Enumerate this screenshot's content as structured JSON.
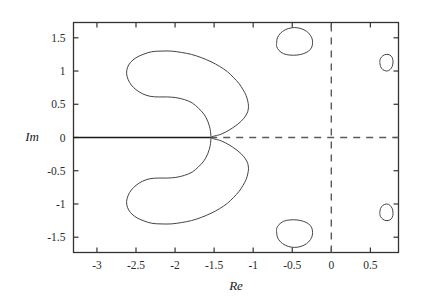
{
  "chart_data": {
    "type": "line",
    "title": "",
    "xlabel": "Re",
    "ylabel": "Im",
    "xlim": [
      -3.3,
      0.86
    ],
    "ylim": [
      -1.73,
      1.73
    ],
    "grid": false,
    "legend": null,
    "x_ticks": [
      -3,
      -2.5,
      -2,
      -1.5,
      -1,
      -0.5,
      0,
      0.5
    ],
    "x_tick_labels": [
      "-3",
      "-2.5",
      "-2",
      "-1.5",
      "-1",
      "-0.5",
      "0",
      "0.5"
    ],
    "y_ticks": [
      1.5,
      1,
      0.5,
      0,
      -0.5,
      -1,
      -1.5
    ],
    "y_tick_labels": [
      "1.5",
      "1",
      "0.5",
      "0",
      "-0.5",
      "-1",
      "-1.5"
    ],
    "reference_lines": [
      {
        "name": "real-axis-solid",
        "orientation": "horizontal",
        "value": 0,
        "style": "solid",
        "x_from": -3.3,
        "x_to": -1.55
      },
      {
        "name": "real-axis-dashed",
        "orientation": "horizontal",
        "value": 0,
        "style": "dashed",
        "x_from": -1.55,
        "x_to": 0.86
      },
      {
        "name": "imaginary-axis-dashed",
        "orientation": "vertical",
        "value": 0,
        "style": "dashed",
        "y_from": -1.73,
        "y_to": 1.73
      }
    ],
    "series": [
      {
        "name": "main-crescent-region",
        "closed": true,
        "style": "solid",
        "points": [
          [
            -1.54,
            0.0
          ],
          [
            -1.55,
            0.12
          ],
          [
            -1.58,
            0.24
          ],
          [
            -1.63,
            0.35
          ],
          [
            -1.7,
            0.44
          ],
          [
            -1.78,
            0.52
          ],
          [
            -1.88,
            0.57
          ],
          [
            -1.99,
            0.6
          ],
          [
            -2.1,
            0.61
          ],
          [
            -2.21,
            0.61
          ],
          [
            -2.32,
            0.62
          ],
          [
            -2.42,
            0.66
          ],
          [
            -2.5,
            0.72
          ],
          [
            -2.56,
            0.79
          ],
          [
            -2.6,
            0.87
          ],
          [
            -2.62,
            0.96
          ],
          [
            -2.61,
            1.05
          ],
          [
            -2.57,
            1.13
          ],
          [
            -2.5,
            1.2
          ],
          [
            -2.41,
            1.25
          ],
          [
            -2.3,
            1.29
          ],
          [
            -2.18,
            1.3
          ],
          [
            -2.05,
            1.3
          ],
          [
            -1.92,
            1.28
          ],
          [
            -1.79,
            1.25
          ],
          [
            -1.66,
            1.2
          ],
          [
            -1.54,
            1.14
          ],
          [
            -1.43,
            1.07
          ],
          [
            -1.33,
            0.99
          ],
          [
            -1.25,
            0.9
          ],
          [
            -1.18,
            0.81
          ],
          [
            -1.13,
            0.72
          ],
          [
            -1.09,
            0.63
          ],
          [
            -1.07,
            0.55
          ],
          [
            -1.06,
            0.47
          ],
          [
            -1.07,
            0.39
          ],
          [
            -1.1,
            0.32
          ],
          [
            -1.15,
            0.25
          ],
          [
            -1.22,
            0.18
          ],
          [
            -1.31,
            0.11
          ],
          [
            -1.41,
            0.05
          ],
          [
            -1.54,
            0.0
          ],
          [
            -1.41,
            -0.05
          ],
          [
            -1.31,
            -0.11
          ],
          [
            -1.22,
            -0.18
          ],
          [
            -1.15,
            -0.25
          ],
          [
            -1.1,
            -0.32
          ],
          [
            -1.07,
            -0.39
          ],
          [
            -1.06,
            -0.47
          ],
          [
            -1.07,
            -0.55
          ],
          [
            -1.09,
            -0.63
          ],
          [
            -1.13,
            -0.72
          ],
          [
            -1.18,
            -0.81
          ],
          [
            -1.25,
            -0.9
          ],
          [
            -1.33,
            -0.99
          ],
          [
            -1.43,
            -1.07
          ],
          [
            -1.54,
            -1.14
          ],
          [
            -1.66,
            -1.2
          ],
          [
            -1.79,
            -1.25
          ],
          [
            -1.92,
            -1.28
          ],
          [
            -2.05,
            -1.3
          ],
          [
            -2.18,
            -1.3
          ],
          [
            -2.3,
            -1.29
          ],
          [
            -2.41,
            -1.25
          ],
          [
            -2.5,
            -1.2
          ],
          [
            -2.57,
            -1.13
          ],
          [
            -2.61,
            -1.05
          ],
          [
            -2.62,
            -0.96
          ],
          [
            -2.6,
            -0.87
          ],
          [
            -2.56,
            -0.79
          ],
          [
            -2.5,
            -0.72
          ],
          [
            -2.42,
            -0.66
          ],
          [
            -2.32,
            -0.62
          ],
          [
            -2.21,
            -0.61
          ],
          [
            -2.1,
            -0.61
          ],
          [
            -1.99,
            -0.6
          ],
          [
            -1.88,
            -0.57
          ],
          [
            -1.78,
            -0.52
          ],
          [
            -1.7,
            -0.44
          ],
          [
            -1.63,
            -0.35
          ],
          [
            -1.58,
            -0.24
          ],
          [
            -1.55,
            -0.12
          ],
          [
            -1.54,
            0.0
          ]
        ]
      },
      {
        "name": "upper-blob-region",
        "closed": true,
        "style": "solid",
        "center": [
          -0.52,
          1.43
        ],
        "points": [
          [
            -0.7,
            1.42
          ],
          [
            -0.69,
            1.5
          ],
          [
            -0.65,
            1.57
          ],
          [
            -0.59,
            1.62
          ],
          [
            -0.51,
            1.65
          ],
          [
            -0.43,
            1.65
          ],
          [
            -0.35,
            1.62
          ],
          [
            -0.29,
            1.57
          ],
          [
            -0.25,
            1.5
          ],
          [
            -0.24,
            1.43
          ],
          [
            -0.25,
            1.36
          ],
          [
            -0.29,
            1.3
          ],
          [
            -0.36,
            1.26
          ],
          [
            -0.44,
            1.24
          ],
          [
            -0.53,
            1.24
          ],
          [
            -0.61,
            1.26
          ],
          [
            -0.67,
            1.31
          ],
          [
            -0.7,
            1.37
          ],
          [
            -0.7,
            1.42
          ]
        ]
      },
      {
        "name": "lower-blob-region",
        "closed": true,
        "style": "solid",
        "center": [
          -0.52,
          -1.43
        ],
        "points": [
          [
            -0.7,
            -1.42
          ],
          [
            -0.69,
            -1.5
          ],
          [
            -0.65,
            -1.57
          ],
          [
            -0.59,
            -1.62
          ],
          [
            -0.51,
            -1.65
          ],
          [
            -0.43,
            -1.65
          ],
          [
            -0.35,
            -1.62
          ],
          [
            -0.29,
            -1.57
          ],
          [
            -0.25,
            -1.5
          ],
          [
            -0.24,
            -1.43
          ],
          [
            -0.25,
            -1.36
          ],
          [
            -0.29,
            -1.3
          ],
          [
            -0.36,
            -1.26
          ],
          [
            -0.44,
            -1.24
          ],
          [
            -0.53,
            -1.24
          ],
          [
            -0.61,
            -1.26
          ],
          [
            -0.67,
            -1.31
          ],
          [
            -0.7,
            -1.37
          ],
          [
            -0.7,
            -1.42
          ]
        ]
      },
      {
        "name": "upper-right-oval-region",
        "closed": true,
        "style": "solid",
        "center": [
          0.7,
          1.12
        ],
        "points": [
          [
            0.62,
            1.14
          ],
          [
            0.63,
            1.19
          ],
          [
            0.66,
            1.23
          ],
          [
            0.7,
            1.25
          ],
          [
            0.75,
            1.24
          ],
          [
            0.78,
            1.2
          ],
          [
            0.79,
            1.14
          ],
          [
            0.78,
            1.07
          ],
          [
            0.75,
            1.02
          ],
          [
            0.71,
            1.0
          ],
          [
            0.66,
            1.02
          ],
          [
            0.63,
            1.07
          ],
          [
            0.62,
            1.14
          ]
        ]
      },
      {
        "name": "lower-right-oval-region",
        "closed": true,
        "style": "solid",
        "center": [
          0.7,
          -1.12
        ],
        "points": [
          [
            0.62,
            -1.14
          ],
          [
            0.63,
            -1.19
          ],
          [
            0.66,
            -1.23
          ],
          [
            0.7,
            -1.25
          ],
          [
            0.75,
            -1.24
          ],
          [
            0.78,
            -1.2
          ],
          [
            0.79,
            -1.14
          ],
          [
            0.78,
            -1.07
          ],
          [
            0.75,
            -1.02
          ],
          [
            0.71,
            -1.0
          ],
          [
            0.66,
            -1.02
          ],
          [
            0.63,
            -1.07
          ],
          [
            0.62,
            -1.14
          ]
        ]
      }
    ]
  }
}
